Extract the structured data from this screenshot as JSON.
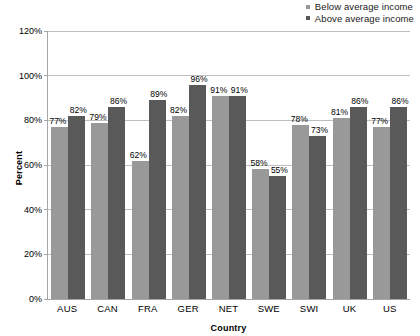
{
  "chart_data": {
    "type": "bar",
    "title": "",
    "xlabel": "Country",
    "ylabel": "Percent",
    "categories": [
      "AUS",
      "CAN",
      "FRA",
      "GER",
      "NET",
      "SWE",
      "SWI",
      "UK",
      "US"
    ],
    "series": [
      {
        "name": "Below average income",
        "color": "#999999",
        "values": [
          77,
          79,
          62,
          82,
          91,
          58,
          78,
          81,
          77
        ],
        "labels": [
          "77%",
          "79%",
          "62%",
          "82%",
          "91%",
          "58%",
          "78%",
          "81%",
          "77%"
        ]
      },
      {
        "name": "Above average income",
        "color": "#595959",
        "values": [
          82,
          86,
          89,
          96,
          91,
          55,
          73,
          86,
          86
        ],
        "labels": [
          "82%",
          "86%",
          "89%",
          "96%",
          "91%",
          "55%",
          "73%",
          "86%",
          "86%"
        ]
      }
    ],
    "ylim": [
      0,
      120
    ],
    "y_ticks": [
      0,
      20,
      40,
      60,
      80,
      100,
      120
    ],
    "y_tick_labels": [
      "0%",
      "20%",
      "40%",
      "60%",
      "80%",
      "100%",
      "120%"
    ],
    "grid": true,
    "legend_position": "top-right"
  },
  "legend": {
    "entries": [
      {
        "label": "Below average income",
        "color": "#999999"
      },
      {
        "label": "Above average income",
        "color": "#595959"
      }
    ]
  },
  "axes": {
    "y_title": "Percent",
    "x_title": "Country"
  },
  "colors": {
    "below_average": "#999999",
    "above_average": "#595959",
    "gridline": "#bfbfbf",
    "axis": "#a6a6a6",
    "background": "#ffffff"
  }
}
